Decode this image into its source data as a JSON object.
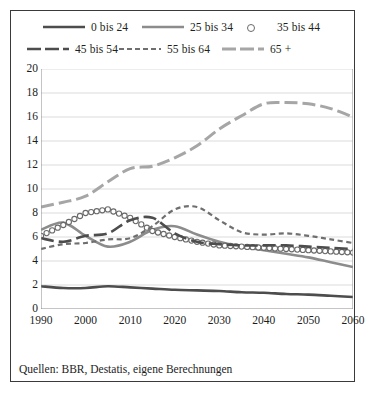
{
  "caption": "Quellen: BBR, Destatis, eigene Berechnungen",
  "legend": {
    "items": [
      {
        "label": "0 bis 24",
        "style": "solid",
        "color": "#4d4d4d",
        "width": 2.6,
        "marker": "none",
        "row": 1
      },
      {
        "label": "25 bis 34",
        "style": "solid",
        "color": "#8c8c8c",
        "width": 2.6,
        "marker": "none",
        "row": 1
      },
      {
        "label": "35 bis 44",
        "style": "none",
        "color": "#6a6a6a",
        "width": 1.2,
        "marker": "circle",
        "row": 1
      },
      {
        "label": "45 bis 54",
        "style": "longdash",
        "color": "#4d4d4d",
        "width": 2.6,
        "marker": "none",
        "row": 2
      },
      {
        "label": "55 bis 64",
        "style": "shortdash",
        "color": "#6f6f6f",
        "width": 2.2,
        "marker": "none",
        "row": 2
      },
      {
        "label": "65 +",
        "style": "longdash",
        "color": "#a6a6a6",
        "width": 3.0,
        "marker": "none",
        "row": 2
      }
    ]
  },
  "chart_data": {
    "type": "line",
    "title": "",
    "xlabel": "",
    "ylabel": "",
    "xlim": [
      1990,
      2060
    ],
    "ylim": [
      0,
      20
    ],
    "xticks": [
      1990,
      2000,
      2010,
      2020,
      2030,
      2040,
      2050,
      2060
    ],
    "yticks": [
      0,
      2,
      4,
      6,
      8,
      10,
      12,
      14,
      16,
      18,
      20
    ],
    "grid": "horizontal",
    "legend_position": "top",
    "x": [
      1990,
      1995,
      2000,
      2005,
      2010,
      2015,
      2020,
      2025,
      2030,
      2035,
      2040,
      2045,
      2050,
      2055,
      2060
    ],
    "series": [
      {
        "name": "0 bis 24",
        "color": "#4d4d4d",
        "style": "solid",
        "values": [
          1.9,
          1.75,
          1.75,
          1.9,
          1.8,
          1.7,
          1.6,
          1.55,
          1.5,
          1.4,
          1.35,
          1.25,
          1.2,
          1.1,
          1.0
        ]
      },
      {
        "name": "25 bis 34",
        "color": "#8c8c8c",
        "style": "solid",
        "values": [
          6.6,
          7.2,
          6.1,
          5.2,
          5.6,
          6.6,
          6.9,
          6.2,
          5.6,
          5.2,
          4.9,
          4.6,
          4.3,
          3.9,
          3.5
        ]
      },
      {
        "name": "35 bis 44",
        "color": "#6a6a6a",
        "style": "markers",
        "marker": "circle",
        "values": [
          6.1,
          7.0,
          8.0,
          8.3,
          7.6,
          6.5,
          6.0,
          5.6,
          5.3,
          5.2,
          5.1,
          5.0,
          4.9,
          4.8,
          4.7
        ]
      },
      {
        "name": "45 bis 54",
        "color": "#4d4d4d",
        "style": "longdash",
        "values": [
          5.9,
          5.6,
          6.1,
          6.3,
          7.4,
          7.6,
          6.3,
          5.6,
          5.4,
          5.3,
          5.3,
          5.3,
          5.2,
          5.1,
          5.0
        ]
      },
      {
        "name": "55 bis 64",
        "color": "#6f6f6f",
        "style": "shortdash",
        "values": [
          5.0,
          5.4,
          5.5,
          5.8,
          5.9,
          6.9,
          8.3,
          8.5,
          7.4,
          6.4,
          6.2,
          6.3,
          6.1,
          5.8,
          5.5
        ]
      },
      {
        "name": "65 +",
        "color": "#a6a6a6",
        "style": "longdash",
        "values": [
          8.5,
          8.9,
          9.4,
          10.6,
          11.7,
          11.9,
          12.6,
          13.6,
          15.0,
          16.1,
          17.1,
          17.2,
          17.1,
          16.7,
          16.0
        ]
      }
    ]
  }
}
